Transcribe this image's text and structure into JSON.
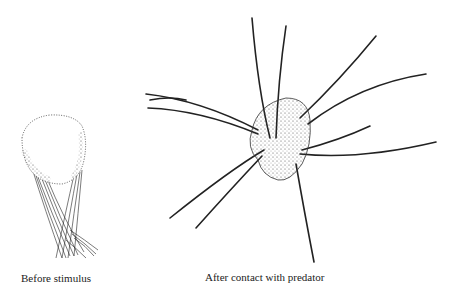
{
  "figure": {
    "panels": [
      {
        "id": "before",
        "caption": "Before stimulus",
        "subject": "harvestman-balled-legs"
      },
      {
        "id": "after",
        "caption": "After contact with predator",
        "subject": "harvestman-legs-extended"
      }
    ],
    "colors": {
      "ink": "#1a1a1a",
      "background": "#ffffff"
    }
  }
}
